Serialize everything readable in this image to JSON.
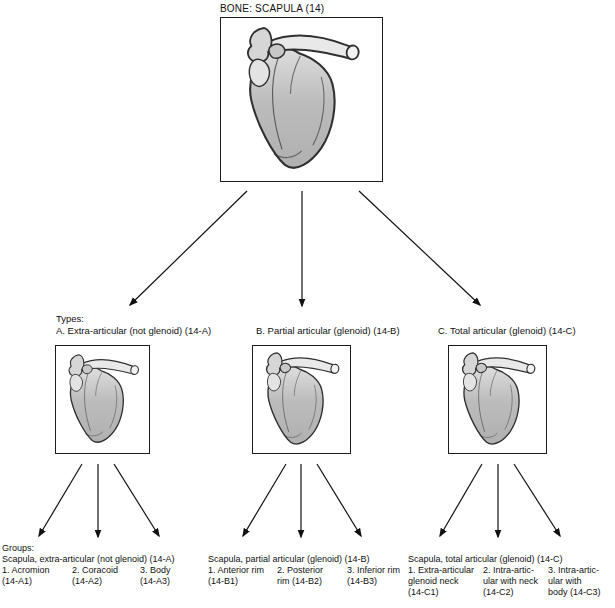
{
  "title": "BONE: SCAPULA (14)",
  "types_heading": "Types:",
  "types": [
    {
      "label": "A. Extra-articular (not glenoid) (14-A)"
    },
    {
      "label": "B. Partial articular (glenoid) (14-B)"
    },
    {
      "label": "C. Total articular (glenoid) (14-C)"
    }
  ],
  "groups_heading": "Groups:",
  "groups": [
    {
      "header": "Scapula, extra-articular (not glenoid) (14-A)",
      "items": [
        {
          "lines": [
            "1. Acromion",
            "(14-A1)"
          ]
        },
        {
          "lines": [
            "2. Coracoid",
            "(14-A2)"
          ]
        },
        {
          "lines": [
            "3. Body",
            "(14-A3)"
          ]
        }
      ]
    },
    {
      "header": "Scapula, partial articular (glenoid) (14-B)",
      "items": [
        {
          "lines": [
            "1. Anterior rim",
            "(14-B1)"
          ]
        },
        {
          "lines": [
            "2. Posterior",
            "rim (14-B2)"
          ]
        },
        {
          "lines": [
            "3. Inferior rim",
            "(14-B3)"
          ]
        }
      ]
    },
    {
      "header": "Scapula, total articular (glenoid) (14-C)",
      "items": [
        {
          "lines": [
            "1. Extra-articular",
            "glenoid neck",
            "(14-C1)"
          ]
        },
        {
          "lines": [
            "2. Intra-artic-",
            "ular with neck",
            "(14-C2)"
          ]
        },
        {
          "lines": [
            "3. Intra-artic-",
            "ular with",
            "body (14-C3)"
          ]
        }
      ]
    }
  ],
  "colors": {
    "background": "#ffffff",
    "text": "#111111",
    "box_border": "#1c1c1c",
    "bone_fill": "#b8b8b8",
    "bone_fill_light": "#e9e9e9",
    "bone_outline": "#303030",
    "arrow": "#111111"
  }
}
